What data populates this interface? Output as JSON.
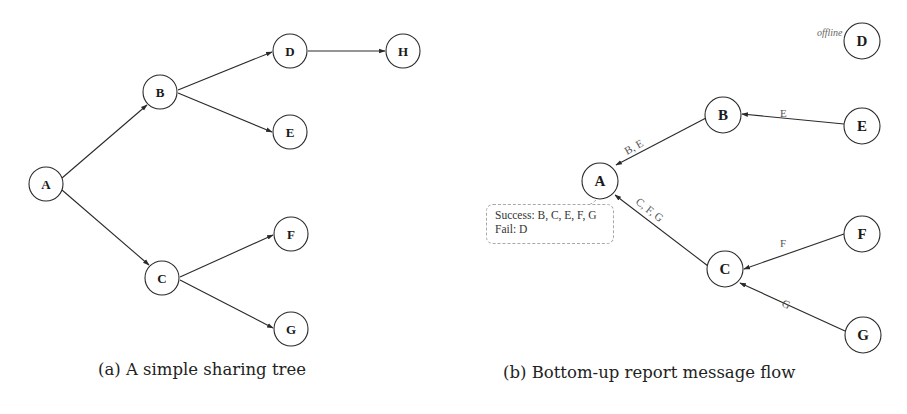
{
  "figure_a": {
    "caption": "(a) A simple sharing tree",
    "nodes": [
      {
        "id": "A",
        "label": "A",
        "x": 46,
        "y": 184
      },
      {
        "id": "B",
        "label": "B",
        "x": 160,
        "y": 92
      },
      {
        "id": "C",
        "label": "C",
        "x": 162,
        "y": 278
      },
      {
        "id": "D",
        "label": "D",
        "x": 290,
        "y": 51
      },
      {
        "id": "E",
        "label": "E",
        "x": 290,
        "y": 132
      },
      {
        "id": "F",
        "label": "F",
        "x": 291,
        "y": 234
      },
      {
        "id": "G",
        "label": "G",
        "x": 291,
        "y": 329
      },
      {
        "id": "H",
        "label": "H",
        "x": 403,
        "y": 51
      }
    ],
    "edges": [
      {
        "from": "A",
        "to": "B"
      },
      {
        "from": "A",
        "to": "C"
      },
      {
        "from": "B",
        "to": "D"
      },
      {
        "from": "B",
        "to": "E"
      },
      {
        "from": "D",
        "to": "H"
      },
      {
        "from": "C",
        "to": "F"
      },
      {
        "from": "C",
        "to": "G"
      }
    ]
  },
  "figure_b": {
    "caption": "(b) Bottom-up report message flow",
    "nodes": [
      {
        "id": "A",
        "label": "A",
        "x": 600,
        "y": 181
      },
      {
        "id": "B",
        "label": "B",
        "x": 723,
        "y": 115
      },
      {
        "id": "C",
        "label": "C",
        "x": 725,
        "y": 269
      },
      {
        "id": "D",
        "label": "D",
        "x": 862,
        "y": 41
      },
      {
        "id": "E",
        "label": "E",
        "x": 862,
        "y": 126
      },
      {
        "id": "F",
        "label": "F",
        "x": 862,
        "y": 234
      },
      {
        "id": "G",
        "label": "G",
        "x": 863,
        "y": 335
      }
    ],
    "edges": [
      {
        "from": "E",
        "to": "B",
        "label": "E"
      },
      {
        "from": "B",
        "to": "A",
        "label": "B, E"
      },
      {
        "from": "F",
        "to": "C",
        "label": "F"
      },
      {
        "from": "G",
        "to": "C",
        "label": "G"
      },
      {
        "from": "C",
        "to": "A",
        "label": "C, F, G"
      }
    ],
    "offline_annotation": {
      "node": "D",
      "text": "offline"
    },
    "report_callout": {
      "success_line": "Success: B, C, E, F, G",
      "fail_line": "Fail: D"
    }
  }
}
